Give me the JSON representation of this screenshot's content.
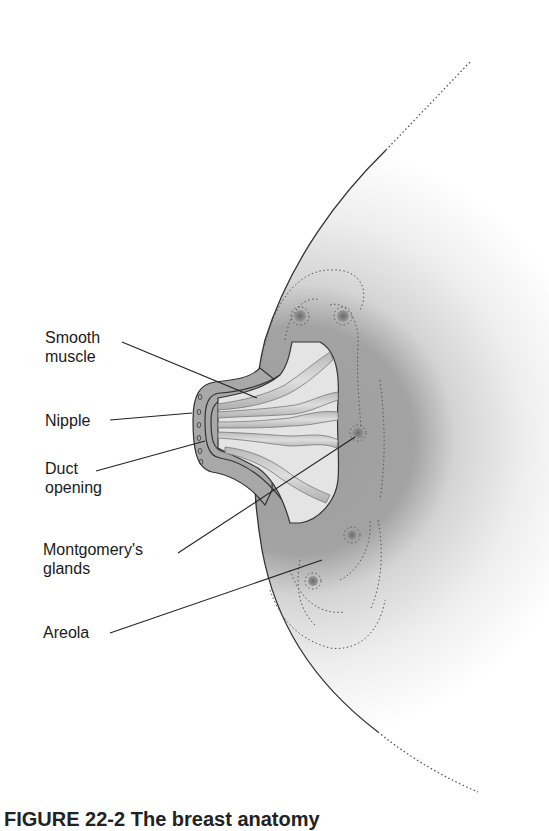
{
  "figure": {
    "labels": {
      "smooth_muscle": {
        "line1": "Smooth",
        "line2": "muscle"
      },
      "nipple": "Nipple",
      "duct_opening": {
        "line1": "Duct",
        "line2": "opening"
      },
      "montgomerys_glands": {
        "line1": "Montgomery's",
        "line2": "glands"
      },
      "areola": "Areola"
    },
    "caption_partial": "FIGURE 22-2  The breast anatomy"
  },
  "colors": {
    "areola": "#9a9a9a",
    "breast_fill": "#f0f0f0",
    "outline": "#333333",
    "gland": "#6f6f6f",
    "duct": "#c9c9c9"
  }
}
